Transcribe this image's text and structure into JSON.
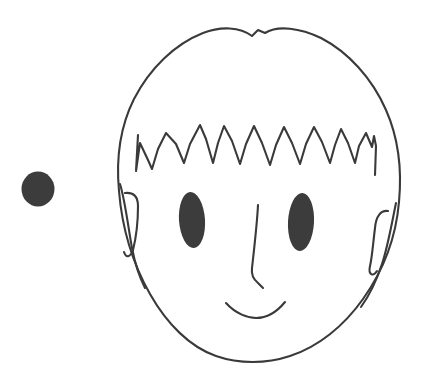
{
  "scene": {
    "title": "Line drawing of a child's face with a separate filled dot",
    "background_color": "#ffffff",
    "width": 428,
    "height": 387,
    "ink_color": "#3a3a3a",
    "fill_color": "#3c3c3c",
    "stroke_width": 2.1
  },
  "shapes": {
    "standalone_dot": {
      "label": "filled-dot",
      "cx": 38,
      "cy": 189,
      "rx": 16.5,
      "ry": 17.5,
      "fill": "#3c3c3c"
    },
    "head_outline": {
      "label": "head-outline",
      "path": "M 258 30 L 252 36 C 240 27 221 26 203 33 C 175 44 150 68 134 99 C 120 127 116 159 119 191 C 122 228 133 264 150 294 C 167 324 190 347 216 356 C 239 364 266 364 290 356 C 318 347 344 326 363 299 C 383 271 396 237 399 202 C 402 170 398 137 386 110 C 372 78 348 52 321 38 C 300 28 278 25 265 33 Z"
    },
    "hairline_zigzag": {
      "label": "hairline-zigzag",
      "path": "M 138 135 L 136 171 L 140 143 L 148 160 L 152 169 L 158 149 L 166 133 L 176 144 L 184 163 L 190 144 L 200 125 L 206 139 L 213 163 L 218 143 L 224 126 L 232 141 L 240 164 L 246 144 L 254 126 L 262 143 L 270 165 L 276 145 L 284 127 L 292 143 L 300 164 L 306 144 L 314 127 L 322 142 L 330 163 L 335 145 L 341 129 L 348 143 L 355 163 L 359 146 L 366 133 L 372 147 L 374 136 L 376 146 L 375 175"
    },
    "left_ear": {
      "label": "left-ear",
      "outer_path": "M 120 184 C 125 200 128 226 132 248 C 135 264 139 276 145 288",
      "inner_path": "M 125 193 C 133 192 138 196 138 206 C 138 222 136 238 133 250 C 130 258 126 258 124 252"
    },
    "right_ear": {
      "label": "right-ear",
      "outer_path": "M 396 203 C 392 222 388 246 382 264 C 376 282 369 296 361 307",
      "inner_path": "M 388 211 C 381 210 376 216 375 228 C 373 244 372 258 370 266 C 368 275 373 277 377 271"
    },
    "left_eye": {
      "label": "left-eye",
      "cx": 192,
      "cy": 220,
      "rx": 13,
      "ry": 28,
      "rotate": -4,
      "fill": "#3c3c3c"
    },
    "right_eye": {
      "label": "right-eye",
      "cx": 301,
      "cy": 222,
      "rx": 13,
      "ry": 29,
      "rotate": 3,
      "fill": "#3c3c3c"
    },
    "nose": {
      "label": "nose",
      "path": "M 258 205 C 257 225 254 250 252 268 C 251 275 253 279 258 283 L 263 288"
    },
    "mouth": {
      "label": "mouth-smile",
      "path": "M 226 303 C 236 314 248 318 256 318 C 265 318 276 313 285 302"
    }
  }
}
